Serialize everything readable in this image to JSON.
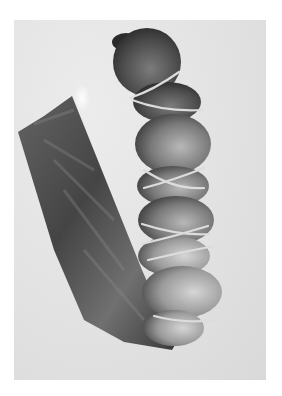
{
  "image": {
    "kind": "black-and-white photograph",
    "subject": "string-tied segmented sausage with dark casing bag",
    "colors": {
      "page_background": "#ffffff",
      "photo_background": "#e2e2e2",
      "sausage_dark": "#2e2e2e",
      "sausage_mid": "#6e6e6e",
      "sausage_light": "#b8b8b8",
      "string": "#d8d8d8",
      "bag_dark": "#3a3a3a",
      "bag_mid": "#5a5a5a"
    }
  }
}
